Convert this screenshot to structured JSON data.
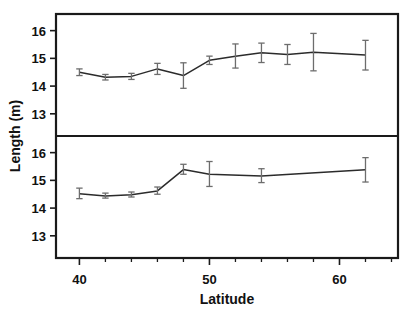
{
  "figure": {
    "width": 415,
    "height": 313,
    "background": "#ffffff",
    "ink_color": "#1a1a1a",
    "line_color": "#2b2b2b",
    "errorbar_color": "#6d6d6d"
  },
  "chart_data": {
    "type": "line",
    "title": "",
    "subtitle": "",
    "xlabel": "Latitude",
    "ylabel": "Length (m)",
    "xlim": [
      38.2,
      64.5
    ],
    "ylim": [
      12.2,
      16.6
    ],
    "grid": false,
    "legend": "none",
    "x_major_ticks": [
      40,
      50,
      60
    ],
    "x_major_tick_labels": [
      "40",
      "50",
      "60"
    ],
    "x_minor_ticks": [
      42,
      44,
      46,
      48,
      52,
      54,
      56,
      58,
      62,
      64
    ],
    "y_major_ticks": [
      13,
      14,
      15,
      16
    ],
    "y_major_tick_labels": [
      "13",
      "14",
      "15",
      "16"
    ],
    "panels": [
      {
        "name": "top-panel",
        "position": "top",
        "x": [
          40,
          42,
          44,
          46,
          48,
          50,
          52,
          54,
          56,
          58,
          62
        ],
        "values": [
          14.5,
          14.32,
          14.35,
          14.62,
          14.38,
          14.93,
          15.08,
          15.2,
          15.14,
          15.22,
          15.12
        ],
        "error_low": [
          14.38,
          14.22,
          14.24,
          14.42,
          13.92,
          14.78,
          14.65,
          14.85,
          14.78,
          14.55,
          14.58
        ],
        "error_high": [
          14.62,
          14.42,
          14.46,
          14.82,
          14.84,
          15.08,
          15.52,
          15.55,
          15.5,
          15.9,
          15.65
        ]
      },
      {
        "name": "bottom-panel",
        "position": "bottom",
        "x": [
          40,
          42,
          44,
          46,
          48,
          50,
          54,
          62
        ],
        "values": [
          14.52,
          14.44,
          14.48,
          14.62,
          15.39,
          15.22,
          15.16,
          15.38
        ],
        "error_low": [
          14.34,
          14.36,
          14.4,
          14.5,
          15.22,
          14.78,
          14.92,
          14.94
        ],
        "error_high": [
          14.72,
          14.54,
          14.58,
          14.76,
          15.58,
          15.68,
          15.42,
          15.82
        ]
      }
    ]
  }
}
